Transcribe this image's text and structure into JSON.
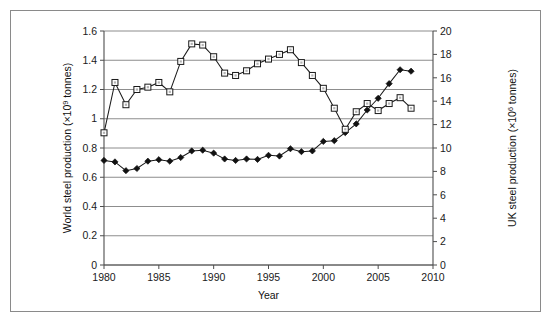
{
  "figure": {
    "name": "world-and-uk-steel-production-chart",
    "border_color": "#8a8a8a",
    "background": "#ffffff"
  },
  "chart_data": {
    "type": "line",
    "title": "",
    "subtitle": "",
    "xlabel": "Year",
    "ylabel": "World steel production (×10⁹ tonnes)",
    "ylabel_secondary": "UK steel production (×10⁶ tonnes)",
    "ylabel_parts": {
      "prefix": "World steel production (×10",
      "sup": "9",
      "suffix": " tonnes)"
    },
    "ylabel_secondary_parts": {
      "prefix": "UK steel production (×10",
      "sup": "6",
      "suffix": " tonnes)"
    },
    "grid": true,
    "legend": "none",
    "xlim": [
      1980,
      2010
    ],
    "ylim": [
      0,
      1.6
    ],
    "ylim_secondary": [
      0,
      20
    ],
    "xticks": [
      1980,
      1985,
      1990,
      1995,
      2000,
      2005,
      2010
    ],
    "xtick_labels": [
      "1980",
      "1985",
      "1990",
      "1995",
      "2000",
      "2005",
      "2010"
    ],
    "yticks": [
      0,
      0.2,
      0.4,
      0.6,
      0.8,
      1.0,
      1.2,
      1.4,
      1.6
    ],
    "ytick_labels": [
      "0",
      "0.2",
      "0.4",
      "0.6",
      "0.8",
      "1",
      "1.2",
      "1.4",
      "1.6"
    ],
    "yticks_secondary": [
      0,
      2,
      4,
      6,
      8,
      10,
      12,
      14,
      16,
      18,
      20
    ],
    "ytick_labels_secondary": [
      "0",
      "2",
      "4",
      "6",
      "8",
      "10",
      "12",
      "14",
      "16",
      "18",
      "20"
    ],
    "x": [
      1980,
      1981,
      1982,
      1983,
      1984,
      1985,
      1986,
      1987,
      1988,
      1989,
      1990,
      1991,
      1992,
      1993,
      1994,
      1995,
      1996,
      1997,
      1998,
      1999,
      2000,
      2001,
      2002,
      2003,
      2004,
      2005,
      2006,
      2007,
      2008
    ],
    "series": [
      {
        "name": "World steel production",
        "axis": "left",
        "marker": "filled-diamond",
        "marker_color": "#111111",
        "line_color": "#1a1a1a",
        "units": "×10^9 tonnes",
        "values": [
          0.715,
          0.705,
          0.645,
          0.66,
          0.71,
          0.72,
          0.71,
          0.735,
          0.78,
          0.785,
          0.765,
          0.725,
          0.715,
          0.725,
          0.722,
          0.75,
          0.745,
          0.795,
          0.775,
          0.78,
          0.845,
          0.85,
          0.905,
          0.965,
          1.06,
          1.14,
          1.24,
          1.335,
          1.325
        ]
      },
      {
        "name": "UK steel production",
        "axis": "right",
        "marker": "open-square",
        "marker_color": "#ffffff",
        "line_color": "#1a1a1a",
        "units": "×10^6 tonnes",
        "values": [
          11.3,
          15.6,
          13.7,
          15.0,
          15.2,
          15.6,
          14.8,
          17.4,
          18.9,
          18.8,
          17.8,
          16.4,
          16.2,
          16.6,
          17.2,
          17.6,
          18.0,
          18.4,
          17.3,
          16.2,
          15.1,
          13.4,
          11.6,
          13.1,
          13.8,
          13.2,
          13.8,
          14.3,
          13.4
        ]
      }
    ]
  },
  "axes": {
    "left_axis_name": "world-steel-production-axis",
    "right_axis_name": "uk-steel-production-axis",
    "x_axis_name": "year-axis"
  }
}
